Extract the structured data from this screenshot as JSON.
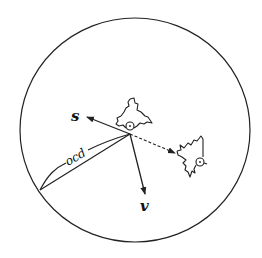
{
  "diagram": {
    "type": "hand-drawn physics/vector diagram",
    "colors": {
      "stroke": "#222222",
      "background": "#ffffff"
    },
    "labels": {
      "s": "s",
      "v": "v",
      "ocd": "ocd"
    },
    "elements": [
      {
        "name": "bounding-circle"
      },
      {
        "name": "bird-upper",
        "eye": [
          130,
          126
        ]
      },
      {
        "name": "bird-right",
        "eye": [
          200,
          162
        ]
      },
      {
        "name": "vector-s",
        "from": [
          130,
          134
        ],
        "to": [
          86,
          117
        ],
        "label": "s"
      },
      {
        "name": "vector-v",
        "from": [
          130,
          134
        ],
        "to": [
          145,
          194
        ],
        "label": "v"
      },
      {
        "name": "dashed-arrow",
        "from": [
          130,
          134
        ],
        "to": [
          175,
          153
        ]
      },
      {
        "name": "vector-ocd",
        "from": [
          40,
          190
        ],
        "to": [
          130,
          134
        ],
        "label": "ocd"
      }
    ]
  }
}
